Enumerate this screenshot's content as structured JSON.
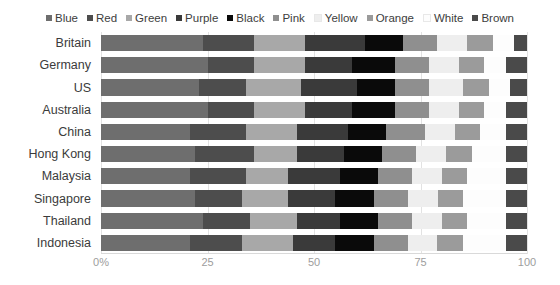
{
  "legend": {
    "position": "top-center",
    "items": [
      {
        "label": "Blue",
        "color": "#6e6e6e"
      },
      {
        "label": "Red",
        "color": "#4d4d4d"
      },
      {
        "label": "Green",
        "color": "#a8a8a8"
      },
      {
        "label": "Purple",
        "color": "#3a3a3a"
      },
      {
        "label": "Black",
        "color": "#0a0a0a"
      },
      {
        "label": "Pink",
        "color": "#8f8f8f"
      },
      {
        "label": "Yellow",
        "color": "#eeeeee"
      },
      {
        "label": "Orange",
        "color": "#9b9b9b"
      },
      {
        "label": "White",
        "color": "#fdfdfd"
      },
      {
        "label": "Brown",
        "color": "#4a4a4a"
      }
    ]
  },
  "axis": {
    "x_ticks": [
      {
        "label": "0%",
        "value": 0
      },
      {
        "label": "25",
        "value": 25
      },
      {
        "label": "50",
        "value": 50
      },
      {
        "label": "75",
        "value": 75
      },
      {
        "label": "100",
        "value": 100
      }
    ],
    "x_min": 0,
    "x_max": 100,
    "grid": true
  },
  "chart_data": {
    "type": "bar",
    "orientation": "horizontal",
    "stacked": true,
    "normalized": true,
    "title": "",
    "subtitle": "",
    "xlabel": "",
    "ylabel": "",
    "xlim": [
      0,
      100
    ],
    "grid": true,
    "legend_position": "top-center",
    "categories": [
      "Britain",
      "Germany",
      "US",
      "Australia",
      "China",
      "Hong Kong",
      "Malaysia",
      "Singapore",
      "Thailand",
      "Indonesia"
    ],
    "series": [
      {
        "name": "Blue",
        "color": "#6e6e6e",
        "values": [
          24,
          25,
          23,
          25,
          21,
          22,
          21,
          22,
          24,
          21
        ]
      },
      {
        "name": "Red",
        "color": "#4d4d4d",
        "values": [
          12,
          11,
          11,
          11,
          13,
          14,
          13,
          11,
          11,
          12
        ]
      },
      {
        "name": "Green",
        "color": "#a8a8a8",
        "values": [
          12,
          12,
          13,
          12,
          12,
          10,
          10,
          11,
          11,
          12
        ]
      },
      {
        "name": "Purple",
        "color": "#3a3a3a",
        "values": [
          14,
          11,
          13,
          11,
          12,
          11,
          12,
          11,
          10,
          10
        ]
      },
      {
        "name": "Black",
        "color": "#0a0a0a",
        "values": [
          9,
          10,
          9,
          10,
          9,
          9,
          9,
          9,
          9,
          9
        ]
      },
      {
        "name": "Pink",
        "color": "#8f8f8f",
        "values": [
          8,
          8,
          8,
          8,
          9,
          8,
          8,
          8,
          8,
          8
        ]
      },
      {
        "name": "Yellow",
        "color": "#eeeeee",
        "values": [
          7,
          7,
          8,
          7,
          7,
          7,
          7,
          7,
          7,
          7
        ]
      },
      {
        "name": "Orange",
        "color": "#9b9b9b",
        "values": [
          6,
          6,
          6,
          6,
          6,
          6,
          6,
          6,
          6,
          6
        ]
      },
      {
        "name": "White",
        "color": "#fdfdfd",
        "values": [
          5,
          5,
          5,
          5,
          6,
          8,
          9,
          10,
          9,
          10
        ]
      },
      {
        "name": "Brown",
        "color": "#4a4a4a",
        "values": [
          3,
          5,
          4,
          5,
          5,
          5,
          5,
          5,
          5,
          5
        ]
      }
    ]
  }
}
